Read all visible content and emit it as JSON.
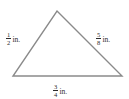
{
  "figure": {
    "type": "triangle-diagram",
    "background_color": "#ffffff",
    "stroke_color": "#8a8a8a",
    "text_color": "#2b2b2b",
    "vertices": {
      "apex": [
        57,
        11
      ],
      "bottom_left": [
        13,
        76
      ],
      "bottom_right": [
        122,
        76
      ]
    },
    "labels": {
      "left_side": {
        "numerator": "1",
        "denominator": "2",
        "unit": "in."
      },
      "right_side": {
        "numerator": "5",
        "denominator": "8",
        "unit": "in."
      },
      "bottom_side": {
        "numerator": "3",
        "denominator": "4",
        "unit": "in."
      }
    }
  }
}
